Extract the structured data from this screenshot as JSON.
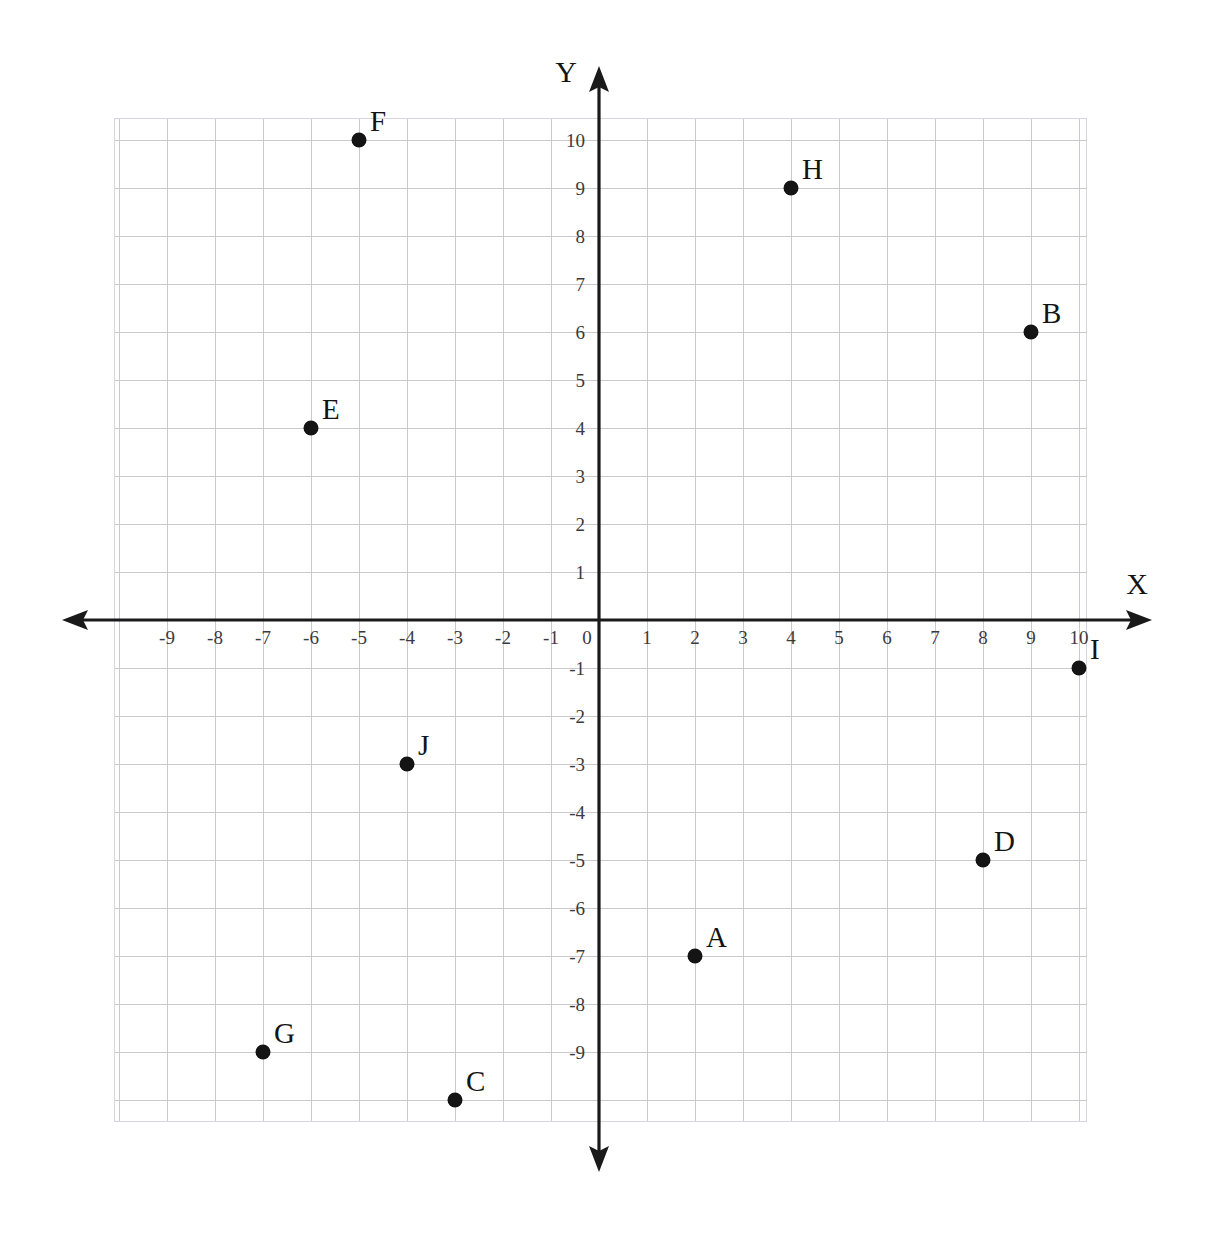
{
  "chart_data": {
    "type": "scatter",
    "title": "",
    "xlabel": "X",
    "ylabel": "Y",
    "xlim": [
      -10,
      10.4
    ],
    "ylim": [
      -10.4,
      10.5
    ],
    "grid": true,
    "legend": "none",
    "x_ticks": [
      "-9",
      "-8",
      "-7",
      "-6",
      "-5",
      "-4",
      "-3",
      "-2",
      "-1",
      "0",
      "1",
      "2",
      "3",
      "4",
      "5",
      "6",
      "7",
      "8",
      "9",
      "10"
    ],
    "y_ticks": [
      "10",
      "9",
      "8",
      "7",
      "6",
      "5",
      "4",
      "3",
      "2",
      "1",
      "0",
      "-1",
      "-2",
      "-3",
      "-4",
      "-5",
      "-6",
      "-7",
      "-8",
      "-9"
    ],
    "points": [
      {
        "label": "A",
        "x": 2,
        "y": -7
      },
      {
        "label": "B",
        "x": 9,
        "y": 6
      },
      {
        "label": "C",
        "x": -3,
        "y": -10
      },
      {
        "label": "D",
        "x": 8,
        "y": -5
      },
      {
        "label": "E",
        "x": -6,
        "y": 4
      },
      {
        "label": "F",
        "x": -5,
        "y": 10
      },
      {
        "label": "G",
        "x": -7,
        "y": -9
      },
      {
        "label": "H",
        "x": 4,
        "y": 9
      },
      {
        "label": "I",
        "x": 10,
        "y": -1
      },
      {
        "label": "J",
        "x": -4,
        "y": -3
      }
    ],
    "point_color": "#141414",
    "grid_color": "#c9c9cf",
    "axis_color": "#1a1a1a"
  },
  "axes": {
    "x_label": "X",
    "y_label": "Y"
  }
}
